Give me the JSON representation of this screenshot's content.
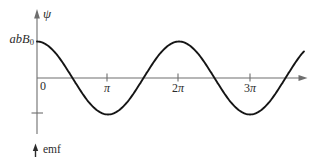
{
  "figure": {
    "y_axis_label": "ψ",
    "amplitude_label": {
      "main": "abB",
      "sub": "0"
    },
    "origin_label": "0",
    "x_tick_pi": "π",
    "x_tick_2pi_num": "2",
    "x_tick_2pi_sym": "π",
    "x_tick_3pi_num": "3",
    "x_tick_3pi_sym": "π",
    "emf_label": "emf"
  },
  "colors": {
    "background": "#ffffff",
    "axis": "#6e6e6e",
    "curve": "#151515",
    "text": "#2b2b2b"
  },
  "chart_data": {
    "type": "line",
    "title": "",
    "xlabel": "",
    "ylabel": "ψ (magnetic flux)",
    "x_unit": "radians",
    "x_tick_values_pi": [
      0,
      1,
      2,
      3
    ],
    "x_tick_labels": [
      "0",
      "π",
      "2π",
      "3π"
    ],
    "y_tick_labels": [
      "abB0",
      "-abB0 (unlabeled tick)"
    ],
    "ylim": [
      -1,
      1
    ],
    "y_unit": "abB0",
    "x_range_pi": [
      0,
      3.77
    ],
    "grid": false,
    "legend": false,
    "series": [
      {
        "name": "psi = abB0·cos(theta)",
        "x_pi": [
          0,
          0.5,
          1,
          1.5,
          2,
          2.5,
          3,
          3.5,
          3.77
        ],
        "y_abB0": [
          1,
          0,
          -1,
          0,
          1,
          0,
          -1,
          0,
          0.76
        ]
      }
    ],
    "annotations": [
      "emf (start of second axis below)"
    ]
  }
}
